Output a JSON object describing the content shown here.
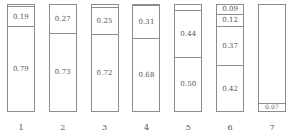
{
  "chart_data": {
    "type": "bar",
    "title": "",
    "xlabel": "",
    "ylabel": "",
    "ylim": [
      0,
      1
    ],
    "grid": false,
    "legend": null,
    "stacked": true,
    "orientation": "vertical",
    "categories": [
      "1",
      "2",
      "3",
      "4",
      "5",
      "6",
      "7"
    ],
    "bars": [
      {
        "category": "1",
        "segments": [
          {
            "value": 0.02,
            "label": "",
            "labeled": false
          },
          {
            "value": 0.19,
            "label": "0.19",
            "labeled": true
          },
          {
            "value": 0.79,
            "label": "0.79",
            "labeled": true
          }
        ]
      },
      {
        "category": "2",
        "segments": [
          {
            "value": 0.27,
            "label": "0.27",
            "labeled": true
          },
          {
            "value": 0.73,
            "label": "0.73",
            "labeled": true
          }
        ]
      },
      {
        "category": "3",
        "segments": [
          {
            "value": 0.03,
            "label": "",
            "labeled": false
          },
          {
            "value": 0.25,
            "label": "0.25",
            "labeled": true
          },
          {
            "value": 0.72,
            "label": "0.72",
            "labeled": true
          }
        ]
      },
      {
        "category": "4",
        "segments": [
          {
            "value": 0.01,
            "label": "",
            "labeled": false
          },
          {
            "value": 0.31,
            "label": "0.31",
            "labeled": true
          },
          {
            "value": 0.68,
            "label": "0.68",
            "labeled": true
          }
        ]
      },
      {
        "category": "5",
        "segments": [
          {
            "value": 0.06,
            "label": "",
            "labeled": false
          },
          {
            "value": 0.44,
            "label": "0.44",
            "labeled": true
          },
          {
            "value": 0.5,
            "label": "0.50",
            "labeled": true
          }
        ]
      },
      {
        "category": "6",
        "segments": [
          {
            "value": 0.09,
            "label": "0.09",
            "labeled": true
          },
          {
            "value": 0.12,
            "label": "0.12",
            "labeled": true
          },
          {
            "value": 0.37,
            "label": "0.37",
            "labeled": true
          },
          {
            "value": 0.42,
            "label": "0.42",
            "labeled": true
          }
        ]
      },
      {
        "category": "7",
        "segments": [
          {
            "value": 0.93,
            "label": "",
            "labeled": false
          },
          {
            "value": 0.07,
            "label": "0.07",
            "labeled": true
          }
        ]
      }
    ]
  },
  "style": {
    "bar_fill": "#ffffff",
    "bar_border": "#8c8c8c",
    "label_color": "#555555",
    "background": "#ffffff"
  }
}
